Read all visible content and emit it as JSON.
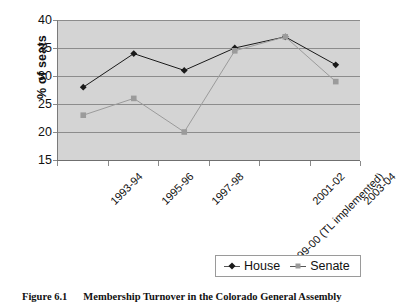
{
  "chart_data": {
    "type": "line",
    "title": "",
    "xlabel": "",
    "ylabel": "% of seats",
    "ylim": [
      15,
      40
    ],
    "yticks": [
      15,
      20,
      25,
      30,
      35,
      40
    ],
    "grid": true,
    "legend_position": "bottom-right",
    "plot_background": "#d4d4d4",
    "categories": [
      "1993-94",
      "1995-96",
      "1997-98",
      "1999-00 (TL implemented)",
      "2001-02",
      "2003-04"
    ],
    "series": [
      {
        "name": "House",
        "marker": "diamond",
        "color": "#1a1a1a",
        "values": [
          28,
          34,
          31,
          35,
          37,
          32
        ]
      },
      {
        "name": "Senate",
        "marker": "square",
        "color": "#9b9b9b",
        "values": [
          23,
          26,
          20,
          34.5,
          37,
          29
        ]
      }
    ]
  },
  "caption": {
    "number": "Figure 6.1",
    "text": "Membership Turnover in the Colorado General Assembly"
  }
}
